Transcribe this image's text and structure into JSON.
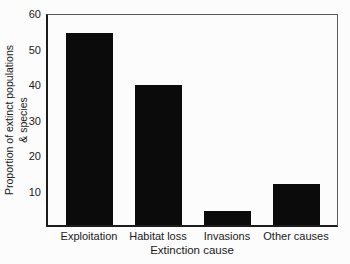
{
  "chart_data": {
    "type": "bar",
    "title": "",
    "categories": [
      "Exploitation",
      "Habitat loss",
      "Invasions",
      "Other causes"
    ],
    "values": [
      54,
      39.5,
      4,
      11.5
    ],
    "xlabel": "Extinction cause",
    "ylabel": "Proportion of extinct populations & species",
    "ylabel_lines": [
      "Proportion of extinct populations",
      "& species"
    ],
    "yticks": [
      10,
      20,
      30,
      40,
      50,
      60
    ],
    "ylim": [
      0,
      60
    ],
    "grid": "off",
    "legend": "none",
    "bar_color": "#0b0b0b",
    "axis_color": "#1c1c1c",
    "background_color": "#fcfcfc"
  }
}
